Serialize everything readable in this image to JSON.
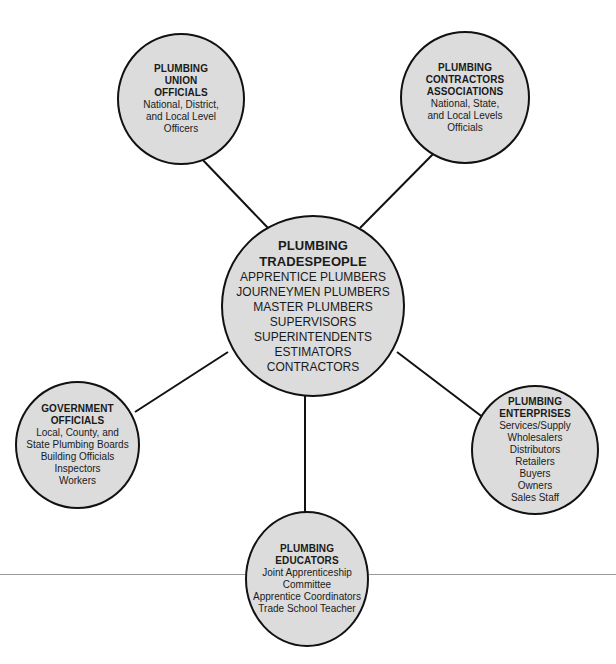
{
  "diagram": {
    "center": {
      "title": [
        "PLUMBING",
        "TRADESPEOPLE"
      ],
      "items": [
        "APPRENTICE PLUMBERS",
        "JOURNEYMEN PLUMBERS",
        "MASTER PLUMBERS",
        "SUPERVISORS",
        "SUPERINTENDENTS",
        "ESTIMATORS",
        "CONTRACTORS"
      ]
    },
    "union": {
      "title": [
        "PLUMBING",
        "UNION",
        "OFFICIALS"
      ],
      "items": [
        "National, District,",
        "and Local Level",
        "Officers"
      ]
    },
    "contractors": {
      "title": [
        "PLUMBING",
        "CONTRACTORS",
        "ASSOCIATIONS"
      ],
      "items": [
        "National, State,",
        "and Local Levels",
        "Officials"
      ]
    },
    "government": {
      "title": [
        "GOVERNMENT",
        "OFFICIALS"
      ],
      "items": [
        "Local, County, and",
        "State Plumbing Boards",
        "Building Officials",
        "Inspectors",
        "Workers"
      ]
    },
    "enterprises": {
      "title": [
        "PLUMBING",
        "ENTERPRISES"
      ],
      "items": [
        "Services/Supply",
        "Wholesalers",
        "Distributors",
        "Retailers",
        "Buyers",
        "Owners",
        "Sales Staff"
      ]
    },
    "educators": {
      "title": [
        "PLUMBING",
        "EDUCATORS"
      ],
      "items": [
        "Joint Apprenticeship",
        "Committee",
        "Apprentice Coordinators",
        "Trade School Teacher"
      ]
    },
    "colors": {
      "circle_fill": "#dcdcdc",
      "stroke": "#111111",
      "rule": "#9a9a9a"
    }
  }
}
